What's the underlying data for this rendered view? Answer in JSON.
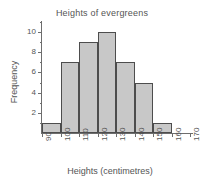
{
  "chart_data": {
    "type": "bar",
    "title": "Heights of evergreens",
    "xlabel": "Heights (centimetres)",
    "ylabel": "Frequency",
    "categories": [
      "90-100",
      "100-110",
      "110-120",
      "120-130",
      "130-140",
      "140-150",
      "150-160"
    ],
    "bin_edges": [
      90,
      100,
      110,
      120,
      130,
      140,
      150,
      160
    ],
    "values": [
      1,
      7,
      9,
      10,
      7,
      5,
      1
    ],
    "xlim": [
      90,
      170
    ],
    "ylim": [
      0,
      11
    ],
    "x_tick_labels": [
      "90",
      "100",
      "110",
      "120",
      "130",
      "140",
      "150",
      "160",
      "170"
    ],
    "x_tick_values": [
      90,
      100,
      110,
      120,
      130,
      140,
      150,
      160,
      170
    ],
    "y_tick_labels": [
      "2",
      "4",
      "6",
      "8",
      "10"
    ],
    "y_tick_values": [
      2,
      4,
      6,
      8,
      10
    ],
    "y_minor_ticks": [
      1,
      3,
      5,
      7,
      9,
      11
    ],
    "grid": false,
    "legend": false,
    "bar_fill_color": "#c8c8c8",
    "bar_edge_color": "#4d4d4d",
    "axis_color": "#6d6d6d",
    "text_color": "#555555",
    "background_color": "#ffffff"
  }
}
